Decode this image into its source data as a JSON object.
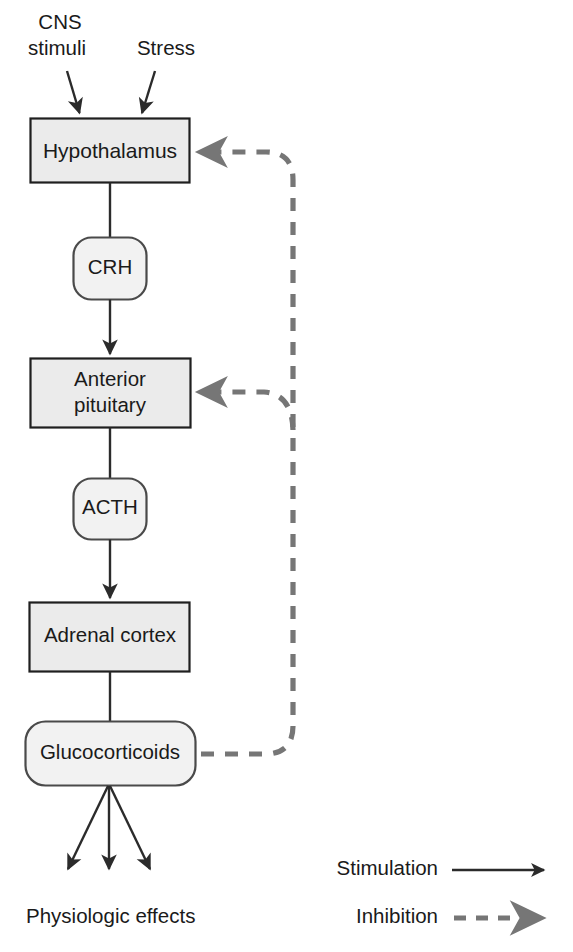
{
  "diagram": {
    "colors": {
      "node_fill": "#ebebeb",
      "node_stroke": "#1f1f1f",
      "stimulation_stroke": "#2b2b2b",
      "inhibition_stroke": "#767676",
      "text": "#1a1a1a",
      "background": "#ffffff"
    },
    "inputs": [
      {
        "id": "cns",
        "line1": "CNS",
        "line2": "stimuli"
      },
      {
        "id": "stress",
        "line1": "Stress",
        "line2": ""
      }
    ],
    "nodes": [
      {
        "id": "hypothalamus",
        "label": "Hypothalamus",
        "shape": "rect"
      },
      {
        "id": "crh",
        "label": "CRH",
        "shape": "rounded"
      },
      {
        "id": "anterior_pituitary",
        "label_line1": "Anterior",
        "label_line2": "pituitary",
        "shape": "rect"
      },
      {
        "id": "acth",
        "label": "ACTH",
        "shape": "rounded"
      },
      {
        "id": "adrenal_cortex",
        "label": "Adrenal cortex",
        "shape": "rect"
      },
      {
        "id": "glucocorticoids",
        "label": "Glucocorticoids",
        "shape": "rounded"
      }
    ],
    "outputs": [
      {
        "id": "physiologic_effects",
        "label": "Physiologic effects"
      }
    ],
    "edges": [
      {
        "from": "cns",
        "to": "hypothalamus",
        "type": "stimulation"
      },
      {
        "from": "stress",
        "to": "hypothalamus",
        "type": "stimulation"
      },
      {
        "from": "hypothalamus",
        "to": "crh",
        "type": "stimulation"
      },
      {
        "from": "crh",
        "to": "anterior_pituitary",
        "type": "stimulation"
      },
      {
        "from": "anterior_pituitary",
        "to": "acth",
        "type": "stimulation"
      },
      {
        "from": "acth",
        "to": "adrenal_cortex",
        "type": "stimulation"
      },
      {
        "from": "adrenal_cortex",
        "to": "glucocorticoids",
        "type": "stimulation"
      },
      {
        "from": "glucocorticoids",
        "to": "physiologic_effects",
        "type": "stimulation"
      },
      {
        "from": "glucocorticoids",
        "to": "hypothalamus",
        "type": "inhibition"
      },
      {
        "from": "glucocorticoids",
        "to": "anterior_pituitary",
        "type": "inhibition"
      }
    ],
    "legend": {
      "items": [
        {
          "id": "stimulation",
          "label": "Stimulation",
          "style": "solid"
        },
        {
          "id": "inhibition",
          "label": "Inhibition",
          "style": "dashed"
        }
      ]
    }
  }
}
